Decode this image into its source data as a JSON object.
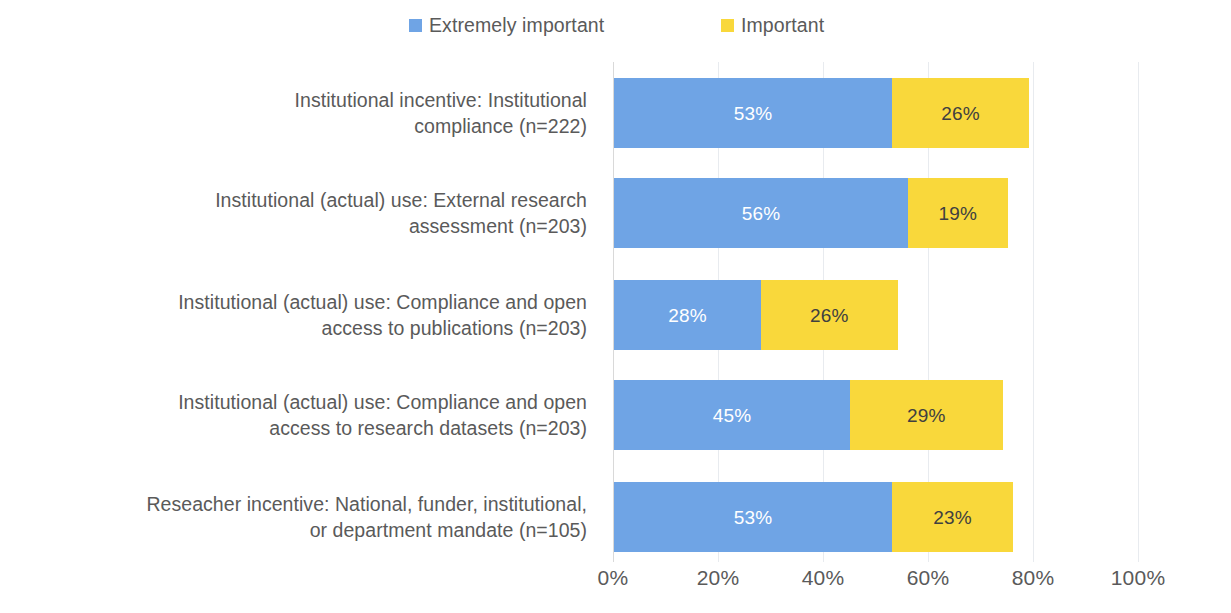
{
  "chart_data": {
    "type": "bar",
    "orientation": "horizontal",
    "stacked": true,
    "title": "",
    "subtitle": "",
    "xlabel": "",
    "ylabel": "",
    "xlim": [
      0,
      100
    ],
    "xticks": [
      "0%",
      "20%",
      "40%",
      "60%",
      "80%",
      "100%"
    ],
    "xtick_values": [
      0,
      20,
      40,
      60,
      80,
      100
    ],
    "grid": true,
    "legend_position": "top",
    "categories": [
      "Institutional incentive: Institutional compliance (n=222)",
      "Institutional (actual) use: External research assessment (n=203)",
      "Institutional (actual) use: Compliance and open access to publications (n=203)",
      "Institutional (actual) use: Compliance and open access to research datasets (n=203)",
      "Reseacher incentive: National, funder, institutional, or department mandate (n=105)"
    ],
    "category_lines": [
      [
        "Institutional incentive: Institutional",
        "compliance (n=222)"
      ],
      [
        "Institutional (actual) use: External research",
        "assessment (n=203)"
      ],
      [
        "Institutional (actual) use: Compliance and open",
        "access to publications (n=203)"
      ],
      [
        "Institutional (actual) use: Compliance and open",
        "access to research datasets (n=203)"
      ],
      [
        "Reseacher incentive: National, funder, institutional,",
        "or department mandate (n=105)"
      ]
    ],
    "series": [
      {
        "name": "Extremely important",
        "color": "#6FA4E5",
        "values": [
          53,
          56,
          28,
          45,
          53
        ],
        "labels": [
          "53%",
          "56%",
          "28%",
          "45%",
          "53%"
        ]
      },
      {
        "name": "Important",
        "color": "#F9D83B",
        "values": [
          26,
          19,
          26,
          29,
          23
        ],
        "labels": [
          "26%",
          "19%",
          "26%",
          "29%",
          "23%"
        ]
      }
    ]
  },
  "legend": {
    "items": [
      {
        "label": "Extremely important",
        "color": "#6FA4E5"
      },
      {
        "label": "Important",
        "color": "#F9D83B"
      }
    ]
  },
  "colors": {
    "extremely_important": "#6FA4E5",
    "important": "#F9D83B",
    "text": "#5a5a5a",
    "gridline": "#e8ebef",
    "axis": "#d9d9d9",
    "background": "#ffffff"
  }
}
